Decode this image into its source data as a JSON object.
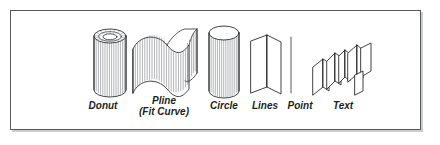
{
  "figure": {
    "background_color": "#ffffff",
    "frame": {
      "border_color": "#555a5e",
      "shadow_color": "#8c9196",
      "fill_color": "#ffffff"
    },
    "line_color": "#2b2d2f",
    "hatch_color": "#6f7277",
    "objects": [
      {
        "id": "donut",
        "label": "Donut",
        "label_line2": "",
        "shape": "extruded-ring-cylinder",
        "description": "Cylinder with annular (donut) top face showing concentric ellipses and radial ruling lines"
      },
      {
        "id": "pline",
        "label": "Pline",
        "label_line2": "(Fit Curve)",
        "shape": "extruded-s-curve-wall",
        "description": "S-shaped fitted polyline extruded into a curved wall with vertical ruling lines"
      },
      {
        "id": "circle",
        "label": "Circle",
        "label_line2": "",
        "shape": "extruded-cylinder",
        "description": "Circle extruded into a solid cylinder with elliptical top face"
      },
      {
        "id": "lines",
        "label": "Lines",
        "label_line2": "",
        "shape": "extruded-chevron-walls",
        "description": "Two connected lines extruded into a V-shaped pair of vertical planes"
      },
      {
        "id": "point",
        "label": "Point",
        "label_line2": "",
        "shape": "extruded-vertical-line",
        "description": "Point extruded into a single thin vertical line"
      },
      {
        "id": "text",
        "label": "Text",
        "label_line2": "",
        "shape": "extruded-text-panels",
        "description": "Text extruded into a cluster of angled 3D panels"
      }
    ]
  }
}
